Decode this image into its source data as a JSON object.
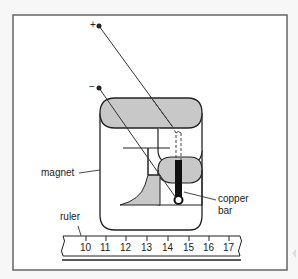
{
  "diagram": {
    "type": "physics apparatus illustration",
    "terminals": {
      "positive": "+",
      "negative": "−"
    },
    "labels": {
      "magnet": "magnet",
      "ruler": "ruler",
      "copper_bar_line1": "copper",
      "copper_bar_line2": "bar"
    },
    "ruler": {
      "ticks": [
        "10",
        "11",
        "12",
        "13",
        "14",
        "15",
        "16",
        "17"
      ]
    },
    "colors": {
      "frame": "#555555",
      "background": "#ffffff",
      "pole_fill": "#c8c8c8",
      "copper_bar": "#111111",
      "line": "#333333"
    }
  }
}
